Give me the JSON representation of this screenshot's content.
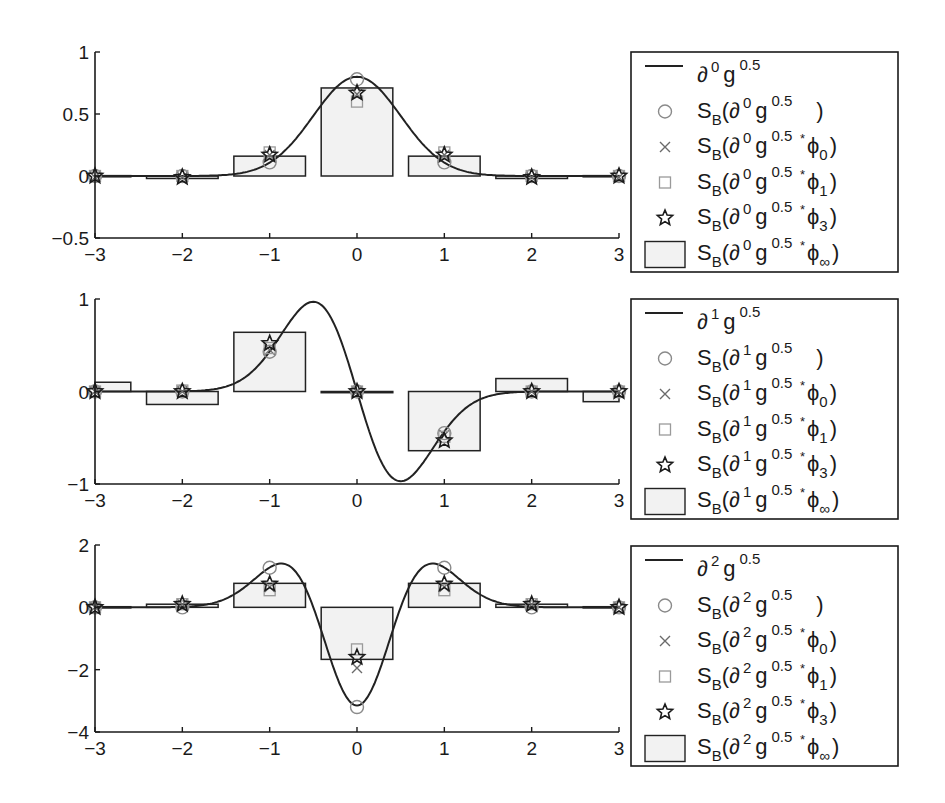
{
  "figure": {
    "background": "#ffffff",
    "colors": {
      "axis": "#1a1a1a",
      "curve": "#222222",
      "bar_edge": "#222222",
      "bar_fill": "#f2f2f2",
      "circle": "#8a8a8a",
      "cross": "#6a6a6a",
      "square": "#9a9a9a",
      "star": "#1a1a1a"
    }
  },
  "chart_data": [
    {
      "type": "line+bar+scatter",
      "title": "",
      "xlabel": "",
      "ylabel": "",
      "derivative_order": 0,
      "xlim": [
        -3,
        3
      ],
      "ylim": [
        -0.5,
        1
      ],
      "xticks": [
        -3,
        -2,
        -1,
        0,
        1,
        2,
        3
      ],
      "yticks": [
        -0.5,
        0,
        0.5,
        1
      ],
      "ytick_labels": [
        "-0.5",
        "0",
        "0.5",
        "1"
      ],
      "grid": false,
      "legend_position": "outside right",
      "curve": {
        "name": "∂⁰g^0.5",
        "function": "gaussian",
        "sigma": 0.5,
        "derivative": 0
      },
      "x": [
        -3,
        -2,
        -1,
        0,
        1,
        2,
        3
      ],
      "series": [
        {
          "name": "S_B(∂⁰g^0.5)",
          "marker": "circle",
          "values": [
            0.0,
            0.0,
            0.11,
            0.78,
            0.11,
            0.0,
            0.0
          ]
        },
        {
          "name": "S_B(∂⁰g^0.5 * φ0)",
          "marker": "x",
          "values": [
            -0.01,
            -0.01,
            0.17,
            0.66,
            0.17,
            -0.01,
            -0.01
          ]
        },
        {
          "name": "S_B(∂⁰g^0.5 * φ1)",
          "marker": "square",
          "values": [
            0.0,
            0.0,
            0.19,
            0.6,
            0.19,
            0.0,
            0.0
          ]
        },
        {
          "name": "S_B(∂⁰g^0.5 * φ3)",
          "marker": "star",
          "values": [
            0.0,
            -0.01,
            0.17,
            0.67,
            0.17,
            -0.01,
            0.0
          ]
        },
        {
          "name": "S_B(∂⁰g^0.5 * φ∞)",
          "marker": "bar",
          "values": [
            0.003,
            -0.02,
            0.16,
            0.71,
            0.16,
            -0.02,
            0.003
          ]
        }
      ],
      "legend": [
        {
          "symbol": "line",
          "base": "",
          "deriv": "0",
          "conv": "",
          "sub": ""
        },
        {
          "symbol": "circle",
          "base": "S",
          "deriv": "0",
          "conv": "",
          "sub": ""
        },
        {
          "symbol": "x",
          "base": "S",
          "deriv": "0",
          "conv": "*",
          "sub": "0"
        },
        {
          "symbol": "square",
          "base": "S",
          "deriv": "0",
          "conv": "*",
          "sub": "1"
        },
        {
          "symbol": "star",
          "base": "S",
          "deriv": "0",
          "conv": "*",
          "sub": "3"
        },
        {
          "symbol": "bar",
          "base": "S",
          "deriv": "0",
          "conv": "*",
          "sub": "∞"
        }
      ]
    },
    {
      "type": "line+bar+scatter",
      "title": "",
      "xlabel": "",
      "ylabel": "",
      "derivative_order": 1,
      "xlim": [
        -3,
        3
      ],
      "ylim": [
        -1,
        1
      ],
      "xticks": [
        -3,
        -2,
        -1,
        0,
        1,
        2,
        3
      ],
      "yticks": [
        -1,
        0,
        1
      ],
      "ytick_labels": [
        "-1",
        "0",
        "1"
      ],
      "grid": false,
      "legend_position": "outside right",
      "curve": {
        "name": "∂¹g^0.5",
        "function": "gaussian",
        "sigma": 0.5,
        "derivative": 1
      },
      "x": [
        -3,
        -2,
        -1,
        0,
        1,
        2,
        3
      ],
      "series": [
        {
          "name": "S_B(∂¹g^0.5)",
          "marker": "circle",
          "values": [
            0.0,
            0.0,
            0.43,
            0.0,
            -0.45,
            0.0,
            0.0
          ]
        },
        {
          "name": "S_B(∂¹g^0.5 * φ0)",
          "marker": "x",
          "values": [
            0.0,
            0.0,
            0.45,
            0.0,
            -0.47,
            0.0,
            0.0
          ]
        },
        {
          "name": "S_B(∂¹g^0.5 * φ1)",
          "marker": "square",
          "values": [
            0.0,
            0.01,
            0.47,
            0.0,
            -0.49,
            0.0,
            0.0
          ]
        },
        {
          "name": "S_B(∂¹g^0.5 * φ3)",
          "marker": "star",
          "values": [
            0.0,
            0.0,
            0.52,
            0.0,
            -0.53,
            0.0,
            0.0
          ]
        },
        {
          "name": "S_B(∂¹g^0.5 * φ∞)",
          "marker": "bar",
          "values": [
            0.1,
            -0.14,
            0.64,
            0.0,
            -0.64,
            0.14,
            -0.11
          ]
        }
      ],
      "legend": [
        {
          "symbol": "line",
          "base": "",
          "deriv": "1",
          "conv": "",
          "sub": ""
        },
        {
          "symbol": "circle",
          "base": "S",
          "deriv": "1",
          "conv": "",
          "sub": ""
        },
        {
          "symbol": "x",
          "base": "S",
          "deriv": "1",
          "conv": "*",
          "sub": "0"
        },
        {
          "symbol": "square",
          "base": "S",
          "deriv": "1",
          "conv": "*",
          "sub": "1"
        },
        {
          "symbol": "star",
          "base": "S",
          "deriv": "1",
          "conv": "*",
          "sub": "3"
        },
        {
          "symbol": "bar",
          "base": "S",
          "deriv": "1",
          "conv": "*",
          "sub": "∞"
        }
      ]
    },
    {
      "type": "line+bar+scatter",
      "title": "",
      "xlabel": "",
      "ylabel": "",
      "derivative_order": 2,
      "xlim": [
        -3,
        3
      ],
      "ylim": [
        -4,
        2
      ],
      "xticks": [
        -3,
        -2,
        -1,
        0,
        1,
        2,
        3
      ],
      "yticks": [
        -4,
        -2,
        0,
        2
      ],
      "ytick_labels": [
        "-4",
        "-2",
        "0",
        "2"
      ],
      "grid": false,
      "legend_position": "outside right",
      "curve": {
        "name": "∂²g^0.5",
        "function": "gaussian",
        "sigma": 0.5,
        "derivative": 2
      },
      "x": [
        -3,
        -2,
        -1,
        0,
        1,
        2,
        3
      ],
      "series": [
        {
          "name": "S_B(∂²g^0.5)",
          "marker": "circle",
          "values": [
            0.0,
            0.0,
            1.27,
            -3.2,
            1.27,
            0.0,
            0.0
          ]
        },
        {
          "name": "S_B(∂²g^0.5 * φ0)",
          "marker": "x",
          "values": [
            0.0,
            0.1,
            0.65,
            -1.95,
            0.65,
            0.1,
            0.0
          ]
        },
        {
          "name": "S_B(∂²g^0.5 * φ1)",
          "marker": "square",
          "values": [
            0.0,
            0.1,
            0.55,
            -1.35,
            0.55,
            0.1,
            0.0
          ]
        },
        {
          "name": "S_B(∂²g^0.5 * φ3)",
          "marker": "star",
          "values": [
            0.0,
            0.1,
            0.75,
            -1.6,
            0.75,
            0.1,
            0.0
          ]
        },
        {
          "name": "S_B(∂²g^0.5 * φ∞)",
          "marker": "bar",
          "values": [
            0.02,
            0.1,
            0.77,
            -1.67,
            0.77,
            0.1,
            0.02
          ]
        }
      ],
      "legend": [
        {
          "symbol": "line",
          "base": "",
          "deriv": "2",
          "conv": "",
          "sub": ""
        },
        {
          "symbol": "circle",
          "base": "S",
          "deriv": "2",
          "conv": "",
          "sub": ""
        },
        {
          "symbol": "x",
          "base": "S",
          "deriv": "2",
          "conv": "*",
          "sub": "0"
        },
        {
          "symbol": "square",
          "base": "S",
          "deriv": "2",
          "conv": "*",
          "sub": "1"
        },
        {
          "symbol": "star",
          "base": "S",
          "deriv": "2",
          "conv": "*",
          "sub": "3"
        },
        {
          "symbol": "bar",
          "base": "S",
          "deriv": "2",
          "conv": "*",
          "sub": "∞"
        }
      ]
    }
  ],
  "layout": {
    "panels": [
      {
        "x0": 95,
        "x1": 619,
        "y_top": 52,
        "y_bottom": 238,
        "legend": {
          "x": 631,
          "y": 52,
          "w": 267,
          "h": 220
        }
      },
      {
        "x0": 95,
        "x1": 619,
        "y_top": 299,
        "y_bottom": 484,
        "legend": {
          "x": 631,
          "y": 299,
          "w": 267,
          "h": 220
        }
      },
      {
        "x0": 95,
        "x1": 619,
        "y_top": 545,
        "y_bottom": 732,
        "legend": {
          "x": 631,
          "y": 546,
          "w": 267,
          "h": 220
        }
      }
    ],
    "bar_width": 0.82
  }
}
